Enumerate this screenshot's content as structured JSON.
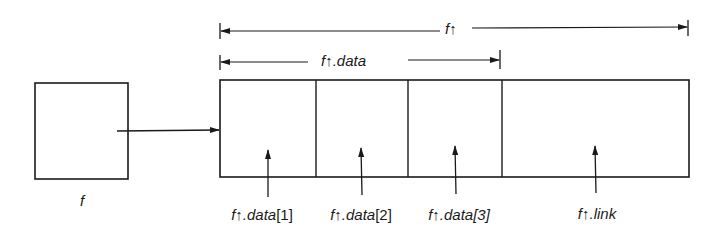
{
  "diagram": {
    "pointer_var": {
      "label": "f"
    },
    "record": {
      "span_label": "f↑",
      "data_span_label": "f↑.data",
      "fields": [
        {
          "name": "data1",
          "label_prefix": "f↑.",
          "label_main": "data",
          "label_index": "[1]"
        },
        {
          "name": "data2",
          "label_prefix": "f↑.",
          "label_main": "data",
          "label_index": "[2]"
        },
        {
          "name": "data3",
          "label_prefix": "f↑.",
          "label_main": "data",
          "label_index": "[3]"
        },
        {
          "name": "link",
          "label_prefix": "f↑.",
          "label_main": "link",
          "label_index": ""
        }
      ]
    },
    "colors": {
      "ink": "#1a1a1a",
      "background": "#ffffff"
    }
  }
}
